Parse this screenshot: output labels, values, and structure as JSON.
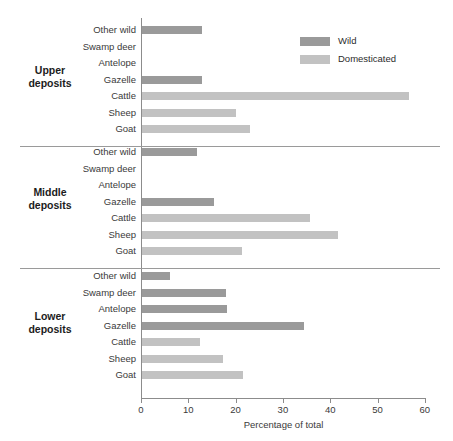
{
  "chart_data": {
    "type": "bar",
    "title": "",
    "orientation": "horizontal",
    "xlabel": "Percentage of total",
    "ylabel": "",
    "xlim": [
      0,
      60
    ],
    "xticks": [
      0,
      10,
      20,
      30,
      40,
      50,
      60
    ],
    "grid": false,
    "legend_position": "top-right",
    "legend": [
      {
        "name": "Wild",
        "color": "#9a9a9a"
      },
      {
        "name": "Domesticated",
        "color": "#c2c2c2"
      }
    ],
    "categories": [
      "Other wild",
      "Swamp deer",
      "Antelope",
      "Gazelle",
      "Cattle",
      "Sheep",
      "Goat"
    ],
    "groups": [
      {
        "name_line1": "Upper",
        "name_line2": "deposits",
        "bars": [
          {
            "category": "Other wild",
            "value": 12.7,
            "series": "Wild"
          },
          {
            "category": "Swamp deer",
            "value": 0,
            "series": "Wild"
          },
          {
            "category": "Antelope",
            "value": 0,
            "series": "Wild"
          },
          {
            "category": "Gazelle",
            "value": 12.7,
            "series": "Wild"
          },
          {
            "category": "Cattle",
            "value": 56.4,
            "series": "Domesticated"
          },
          {
            "category": "Sheep",
            "value": 19.9,
            "series": "Domesticated"
          },
          {
            "category": "Goat",
            "value": 22.8,
            "series": "Domesticated"
          }
        ]
      },
      {
        "name_line1": "Middle",
        "name_line2": "deposits",
        "bars": [
          {
            "category": "Other wild",
            "value": 11.6,
            "series": "Wild"
          },
          {
            "category": "Swamp deer",
            "value": 0,
            "series": "Wild"
          },
          {
            "category": "Antelope",
            "value": 0,
            "series": "Wild"
          },
          {
            "category": "Gazelle",
            "value": 15.2,
            "series": "Wild"
          },
          {
            "category": "Cattle",
            "value": 35.5,
            "series": "Domesticated"
          },
          {
            "category": "Sheep",
            "value": 41.4,
            "series": "Domesticated"
          },
          {
            "category": "Goat",
            "value": 21.1,
            "series": "Domesticated"
          }
        ]
      },
      {
        "name_line1": "Lower",
        "name_line2": "deposits",
        "bars": [
          {
            "category": "Other wild",
            "value": 5.9,
            "series": "Wild"
          },
          {
            "category": "Swamp deer",
            "value": 17.7,
            "series": "Wild"
          },
          {
            "category": "Antelope",
            "value": 17.9,
            "series": "Wild"
          },
          {
            "category": "Gazelle",
            "value": 34.2,
            "series": "Wild"
          },
          {
            "category": "Cattle",
            "value": 12.2,
            "series": "Domesticated"
          },
          {
            "category": "Sheep",
            "value": 17.1,
            "series": "Domesticated"
          },
          {
            "category": "Goat",
            "value": 21.3,
            "series": "Domesticated"
          }
        ]
      }
    ]
  },
  "axis": {
    "tick_labels": [
      "0",
      "10",
      "20",
      "30",
      "40",
      "50",
      "60"
    ],
    "xlabel": "Percentage of total"
  },
  "legend": {
    "wild_label": "Wild",
    "domesticated_label": "Domesticated"
  },
  "colors": {
    "wild": "#9a9a9a",
    "domesticated": "#c2c2c2",
    "axis": "#8c8c8c",
    "separator": "#9a9a9a",
    "text": "#2b2b2b"
  }
}
